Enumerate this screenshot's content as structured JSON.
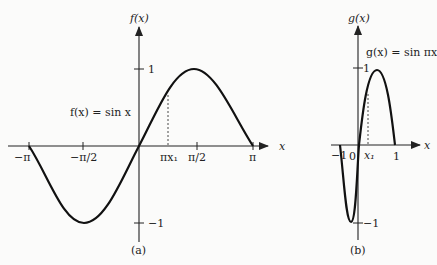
{
  "panel_a": {
    "caption": "(a)",
    "y_axis_label": "f(x)",
    "x_axis_label": "x",
    "function_label": "f(x) = sin x",
    "x_ticks": [
      "−π",
      "−π/2",
      "πx₁",
      "π/2",
      "π"
    ],
    "y_ticks": [
      "1",
      "−1"
    ],
    "x_range": [
      "-pi",
      "pi"
    ],
    "marked_point": "πx₁"
  },
  "panel_b": {
    "caption": "(b)",
    "y_axis_label": "g(x)",
    "x_axis_label": "x",
    "function_label": "g(x) = sin πx",
    "x_ticks": [
      "−1",
      "0",
      "x₁",
      "1"
    ],
    "y_ticks": [
      "1",
      "−1"
    ],
    "x_range": [
      -1,
      1
    ],
    "marked_point": "x₁"
  },
  "colors": {
    "curve": "#111111",
    "axis": "#222222",
    "background": "#fbfbfa"
  }
}
